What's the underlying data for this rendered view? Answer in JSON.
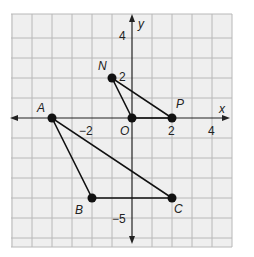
{
  "diagram": {
    "type": "coordinate-plane",
    "axes": {
      "x_label": "x",
      "y_label": "y"
    },
    "tick_labels": {
      "x": [
        {
          "value": -2,
          "text": "−2"
        },
        {
          "value": 2,
          "text": "2"
        },
        {
          "value": 4,
          "text": "4"
        }
      ],
      "y": [
        {
          "value": 4,
          "text": "4"
        },
        {
          "value": 2,
          "text": "2"
        },
        {
          "value": -5,
          "text": "−5"
        }
      ],
      "origin": "O"
    },
    "grid": {
      "x_range": [
        -6,
        5
      ],
      "y_range": [
        -6,
        5
      ]
    },
    "points": [
      {
        "name": "N",
        "x": -1,
        "y": 2
      },
      {
        "name": "O",
        "x": 0,
        "y": 0
      },
      {
        "name": "P",
        "x": 2,
        "y": 0
      },
      {
        "name": "A",
        "x": -4,
        "y": 0
      },
      {
        "name": "B",
        "x": -2,
        "y": -4
      },
      {
        "name": "C",
        "x": 2,
        "y": -4
      }
    ],
    "triangles": [
      {
        "name": "triangle NOP",
        "vertices": [
          "N",
          "O",
          "P"
        ]
      },
      {
        "name": "triangle ABC",
        "vertices": [
          "A",
          "B",
          "C"
        ]
      }
    ],
    "colors": {
      "grid_fill": "#efefef",
      "grid_line": "#b8b8b8",
      "ink": "#111111"
    }
  }
}
